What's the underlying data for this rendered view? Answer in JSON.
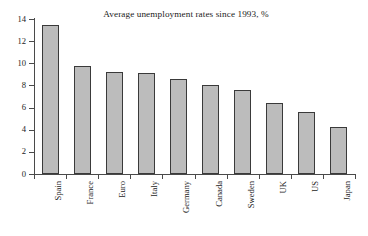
{
  "chart_data": {
    "type": "bar",
    "title": "Average unemployment rates since 1993, %",
    "xlabel": "",
    "ylabel": "",
    "categories": [
      "Spain",
      "France",
      "Euro",
      "Italy",
      "Germany",
      "Canada",
      "Sweden",
      "UK",
      "US",
      "Japan"
    ],
    "values": [
      13.5,
      9.8,
      9.2,
      9.15,
      8.55,
      8.05,
      7.6,
      6.45,
      5.6,
      4.25
    ],
    "ylim": [
      0,
      14
    ],
    "yticks": [
      0,
      2,
      4,
      6,
      8,
      10,
      12,
      14
    ],
    "ytick_labels": [
      "0",
      "2",
      "4",
      "6",
      "8",
      "10",
      "12",
      "14"
    ],
    "grid": false,
    "legend": false,
    "bar_color": "#bcbcbc",
    "bar_edge_color": "#3a3a3a",
    "axis_color": "#4a4a4a",
    "background": "#ffffff"
  }
}
